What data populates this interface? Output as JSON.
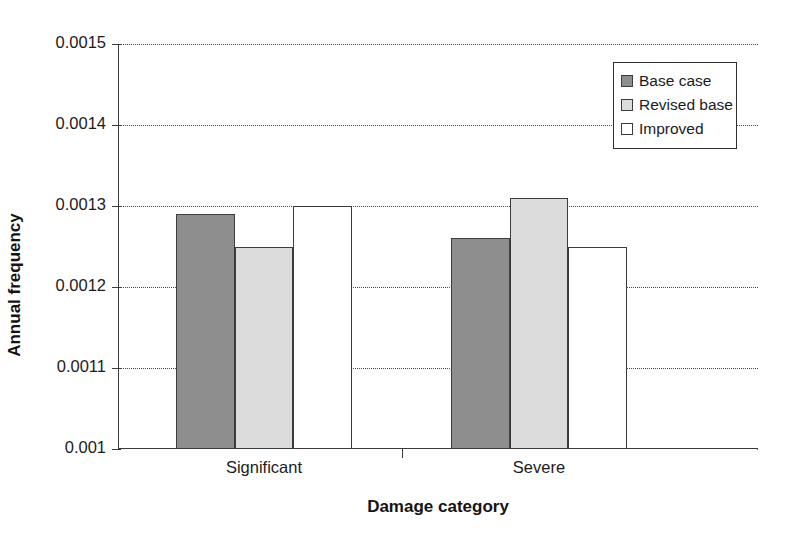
{
  "chart_data": {
    "type": "bar",
    "title": "",
    "xlabel": "Damage category",
    "ylabel": "Annual frequency",
    "categories": [
      "Significant",
      "Severe"
    ],
    "series": [
      {
        "name": "Base case",
        "values": [
          0.00129,
          0.00126
        ],
        "color": "#8e8e8e"
      },
      {
        "name": "Revised base",
        "values": [
          0.00125,
          0.00131
        ],
        "color": "#dcdcdc"
      },
      {
        "name": "Improved",
        "values": [
          0.0013,
          0.00125
        ],
        "color": "#ffffff"
      }
    ],
    "ylim": [
      0.001,
      0.0015
    ],
    "ytick_labels": [
      "0.001",
      "0.0011",
      "0.0012",
      "0.0013",
      "0.0014",
      "0.0015"
    ],
    "ytick_values": [
      0.001,
      0.0011,
      0.0012,
      0.0013,
      0.0014,
      0.0015
    ],
    "grid": true,
    "grid_style": "dotted-horizontal",
    "legend_position": "top-right-inside",
    "xlim_note": "two category groups, clustered bars"
  },
  "axes": {
    "y_title": "Annual frequency",
    "x_title": "Damage category"
  },
  "legend": {
    "items": [
      {
        "label": "Base case"
      },
      {
        "label": "Revised base"
      },
      {
        "label": "Improved"
      }
    ]
  }
}
